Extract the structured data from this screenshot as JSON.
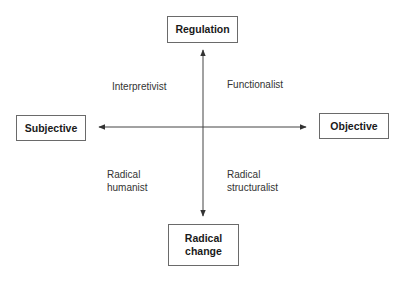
{
  "diagram": {
    "axes": {
      "vertical": {
        "top": "Regulation",
        "bottom": "Radical change"
      },
      "horizontal": {
        "left": "Subjective",
        "right": "Objective"
      }
    },
    "boxes": {
      "regulation": "Regulation",
      "subjective": "Subjective",
      "objective": "Objective",
      "radical_change_line1": "Radical",
      "radical_change_line2": "change"
    },
    "quadrants": {
      "top_left": "Interpretivist",
      "top_right": "Functionalist",
      "bottom_left_line1": "Radical",
      "bottom_left_line2": "humanist",
      "bottom_right_line1": "Radical",
      "bottom_right_line2": "structuralist"
    },
    "colors": {
      "line": "#333333",
      "box_border": "#6a6a6a",
      "text": "#222222"
    }
  }
}
